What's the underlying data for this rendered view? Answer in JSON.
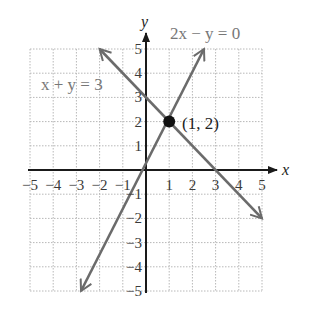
{
  "chart_data": {
    "type": "line",
    "title": "",
    "xlabel": "x",
    "ylabel": "y",
    "xlim": [
      -5,
      5
    ],
    "ylim": [
      -5,
      5
    ],
    "grid": true,
    "x_ticks": [
      -5,
      -4,
      -3,
      -2,
      -1,
      1,
      2,
      3,
      4,
      5
    ],
    "y_ticks": [
      -5,
      -4,
      -3,
      -2,
      -1,
      1,
      2,
      3,
      4,
      5
    ],
    "x_tick_labels": [
      "−5",
      "−4",
      "−3",
      "−2",
      "−1",
      "1",
      "2",
      "3",
      "4",
      "5"
    ],
    "y_tick_labels": [
      "−5",
      "−4",
      "−3",
      "−2",
      "−1",
      "1",
      "2",
      "3",
      "4",
      "5"
    ],
    "series": [
      {
        "name": "x + y = 3",
        "equation": "x + y = 3",
        "x": [
          -2,
          5
        ],
        "y": [
          5,
          -2
        ],
        "color": "#6b6b6b",
        "arrows": "both"
      },
      {
        "name": "2x − y = 0",
        "equation": "2x − y = 0",
        "x": [
          -2.8,
          2.5
        ],
        "y": [
          -5,
          5
        ],
        "color": "#6b6b6b",
        "arrows": "both"
      }
    ],
    "annotations": [
      {
        "text": "(1, 2)",
        "x": 1,
        "y": 2,
        "marker": "filled-circle"
      },
      {
        "text": "x + y = 3",
        "position": "upper-left"
      },
      {
        "text": "2x − y = 0",
        "position": "top-right"
      }
    ]
  },
  "labels": {
    "x_axis": "x",
    "y_axis": "y",
    "line1": "x + y = 3",
    "line2": "2x − y = 0",
    "point": "(1, 2)"
  }
}
